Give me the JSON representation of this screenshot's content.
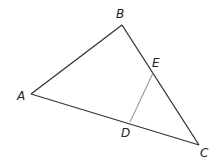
{
  "diagram": {
    "type": "triangle",
    "colors": {
      "triangle": "#333333",
      "segment": "#999999",
      "label": "#222222"
    },
    "points": {
      "A": {
        "label": "A",
        "x": 31,
        "y": 94,
        "lx": 17,
        "ly": 100
      },
      "B": {
        "label": "B",
        "x": 122,
        "y": 25,
        "lx": 116,
        "ly": 18
      },
      "C": {
        "label": "C",
        "x": 199,
        "y": 145,
        "lx": 200,
        "ly": 157
      },
      "D": {
        "label": "D",
        "x": 130,
        "y": 122,
        "lx": 121,
        "ly": 137
      },
      "E": {
        "label": "E",
        "x": 153,
        "y": 73,
        "lx": 152,
        "ly": 67
      }
    },
    "edges": [
      [
        "A",
        "B"
      ],
      [
        "B",
        "C"
      ],
      [
        "C",
        "A"
      ]
    ],
    "segments": [
      [
        "D",
        "E"
      ]
    ]
  }
}
